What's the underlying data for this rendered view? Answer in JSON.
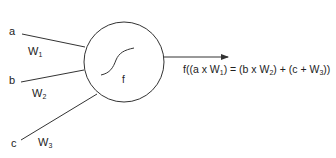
{
  "diagram": {
    "inputs": [
      {
        "label": "a",
        "weight": "W",
        "weight_sub": "1"
      },
      {
        "label": "b",
        "weight": "W",
        "weight_sub": "2"
      },
      {
        "label": "c",
        "weight": "W",
        "weight_sub": "3"
      }
    ],
    "node": {
      "function_label": "f",
      "activation": "sigmoid-curve"
    },
    "output": {
      "formula_parts": {
        "p1": "f((a x W",
        "s1": "1",
        "p2": ") = (b x W",
        "s2": "2",
        "p3": ") + (c + W",
        "s3": "3",
        "p4": "))"
      }
    },
    "colors": {
      "stroke": "#333333",
      "background": "#ffffff"
    }
  }
}
